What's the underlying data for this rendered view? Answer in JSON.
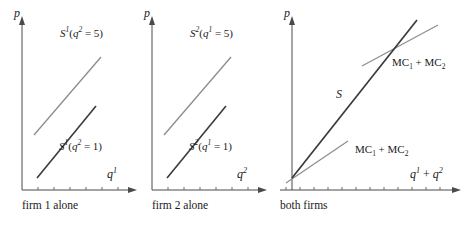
{
  "figure": {
    "panels": [
      {
        "id": "firm-1",
        "caption": "firm 1 alone",
        "y_axis_label": "p",
        "x_axis_label_base": "q",
        "x_axis_label_sup": "1",
        "curves": [
          {
            "name": "upper-supply-curve",
            "label_base": "S",
            "label_sup": "1",
            "label_arg_base": "q",
            "label_arg_sup": "2",
            "label_arg_value": "5",
            "color": "#8c8c8c",
            "x1": 34,
            "y1": 135,
            "x2": 101,
            "y2": 57
          },
          {
            "name": "lower-supply-curve",
            "label_base": "S",
            "label_sup": "1",
            "label_arg_base": "q",
            "label_arg_sup": "2",
            "label_arg_value": "1",
            "color": "#3a3a3a",
            "x1": 37,
            "y1": 178,
            "x2": 96,
            "y2": 106
          }
        ]
      },
      {
        "id": "firm-2",
        "caption": "firm 2 alone",
        "y_axis_label": "p",
        "x_axis_label_base": "q",
        "x_axis_label_sup": "2",
        "curves": [
          {
            "name": "upper-supply-curve",
            "label_base": "S",
            "label_sup": "2",
            "label_arg_base": "q",
            "label_arg_sup": "1",
            "label_arg_value": "5",
            "color": "#8c8c8c",
            "x1": 34,
            "y1": 135,
            "x2": 101,
            "y2": 57
          },
          {
            "name": "lower-supply-curve",
            "label_base": "S",
            "label_sup": "2",
            "label_arg_base": "q",
            "label_arg_sup": "1",
            "label_arg_value": "1",
            "color": "#3a3a3a",
            "x1": 37,
            "y1": 178,
            "x2": 96,
            "y2": 106
          }
        ]
      },
      {
        "id": "both-firms",
        "caption": "both firms",
        "y_axis_label": "p",
        "x_axis_label": "q¹ + q²",
        "x_axis_label_parts": {
          "base1": "q",
          "sup1": "1",
          "plus": "+",
          "base2": "q",
          "sup2": "2"
        },
        "curves": [
          {
            "name": "supply-curve",
            "label": "S",
            "color": "#3a3a3a",
            "x1": 22,
            "y1": 178,
            "x2": 147,
            "y2": 20
          },
          {
            "name": "mc-sum-lower",
            "label_base": "MC",
            "label_sub1": "1",
            "label_plus": "+",
            "label_base2": "MC",
            "label_sub2": "2",
            "color": "#8c8c8c",
            "x1": 16,
            "y1": 183,
            "x2": 78,
            "y2": 141
          },
          {
            "name": "mc-sum-upper",
            "label_base": "MC",
            "label_sub1": "1",
            "label_plus": "+",
            "label_base2": "MC",
            "label_sub2": "2",
            "color": "#8c8c8c",
            "x1": 92,
            "y1": 66,
            "x2": 168,
            "y2": 25
          }
        ]
      }
    ],
    "colors": {
      "axis": "#4a4a4a",
      "curve_dark": "#3a3a3a",
      "curve_light": "#8c8c8c",
      "text": "#1a1a1a"
    }
  }
}
